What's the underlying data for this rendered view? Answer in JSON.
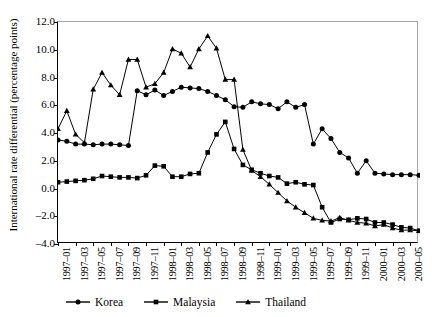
{
  "chart_data": {
    "type": "line",
    "title": "",
    "xlabel": "",
    "ylabel": "International rate differential (percentage points)",
    "ylim": [
      -4.0,
      12.0
    ],
    "yticks": [
      "12.0",
      "10.0",
      "8.0",
      "6.0",
      "4.0",
      "2.0",
      "0.0",
      "-2.0",
      "-4.0"
    ],
    "ytick_values": [
      12.0,
      10.0,
      8.0,
      6.0,
      4.0,
      2.0,
      0.0,
      -2.0,
      -4.0
    ],
    "grid": false,
    "legend_position": "bottom",
    "x": [
      "1997-01",
      "1997-02",
      "1997-03",
      "1997-04",
      "1997-05",
      "1997-06",
      "1997-07",
      "1997-08",
      "1997-09",
      "1997-10",
      "1997-11",
      "1997-12",
      "1998-01",
      "1998-02",
      "1998-03",
      "1998-04",
      "1998-05",
      "1998-06",
      "1998-07",
      "1998-08",
      "1998-09",
      "1998-10",
      "1998-11",
      "1998-12",
      "1999-01",
      "1999-02",
      "1999-03",
      "1999-04",
      "1999-05",
      "1999-06",
      "1999-07",
      "1999-08",
      "1999-09",
      "1999-10",
      "1999-11",
      "1999-12",
      "2000-01",
      "2000-02",
      "2000-03",
      "2000-04",
      "2000-05",
      "2000-06"
    ],
    "xtick_labels": [
      "1997–01",
      "1997–03",
      "1997–05",
      "1997–07",
      "1997–09",
      "1997–11",
      "1998–01",
      "1998–03",
      "1998–05",
      "1998–07",
      "1998–09",
      "1998–11",
      "1999–01",
      "1999–03",
      "1999–05",
      "1999–07",
      "1999–09",
      "1999–11",
      "2000–01",
      "2000–03",
      "2000–05"
    ],
    "series": [
      {
        "name": "Korea",
        "marker": "circle",
        "color": "#000000",
        "values": [
          3.5,
          3.4,
          3.2,
          3.2,
          3.15,
          3.2,
          3.2,
          3.15,
          3.1,
          7.05,
          6.75,
          7.1,
          6.7,
          7.0,
          7.3,
          7.25,
          7.2,
          7.0,
          6.7,
          6.4,
          5.9,
          5.85,
          6.25,
          6.1,
          6.05,
          5.75,
          6.25,
          5.85,
          6.05,
          3.2,
          4.3,
          3.6,
          2.6,
          2.2,
          1.1,
          2.0,
          1.1,
          1.05,
          1.0,
          1.0,
          1.0,
          0.95
        ]
      },
      {
        "name": "Malaysia",
        "marker": "square",
        "color": "#000000",
        "values": [
          0.45,
          0.5,
          0.55,
          0.6,
          0.7,
          0.9,
          0.85,
          0.8,
          0.8,
          0.75,
          0.95,
          1.65,
          1.6,
          0.85,
          0.85,
          1.05,
          1.1,
          2.6,
          3.9,
          4.8,
          2.85,
          1.7,
          1.35,
          1.1,
          0.9,
          0.8,
          0.35,
          0.45,
          0.3,
          0.25,
          -1.35,
          -2.45,
          -2.2,
          -2.25,
          -2.15,
          -2.2,
          -2.45,
          -2.45,
          -2.6,
          -2.8,
          -2.85,
          -3.05
        ]
      },
      {
        "name": "Thailand",
        "marker": "triangle",
        "color": "#000000",
        "values": [
          4.3,
          5.6,
          3.9,
          3.3,
          7.15,
          8.35,
          7.45,
          6.75,
          9.3,
          9.3,
          7.3,
          7.55,
          8.35,
          10.05,
          9.75,
          8.75,
          10.05,
          11.0,
          10.1,
          7.85,
          7.85,
          2.8,
          1.3,
          0.85,
          0.3,
          -0.3,
          -0.9,
          -1.35,
          -1.75,
          -2.15,
          -2.3,
          -2.35,
          -2.1,
          -2.3,
          -2.45,
          -2.5,
          -2.7,
          -2.6,
          -2.85,
          -3.0,
          -3.0,
          -3.05
        ]
      }
    ]
  },
  "legend": {
    "items": [
      {
        "label": "Korea",
        "marker": "circle"
      },
      {
        "label": "Malaysia",
        "marker": "square"
      },
      {
        "label": "Thailand",
        "marker": "triangle"
      }
    ]
  }
}
